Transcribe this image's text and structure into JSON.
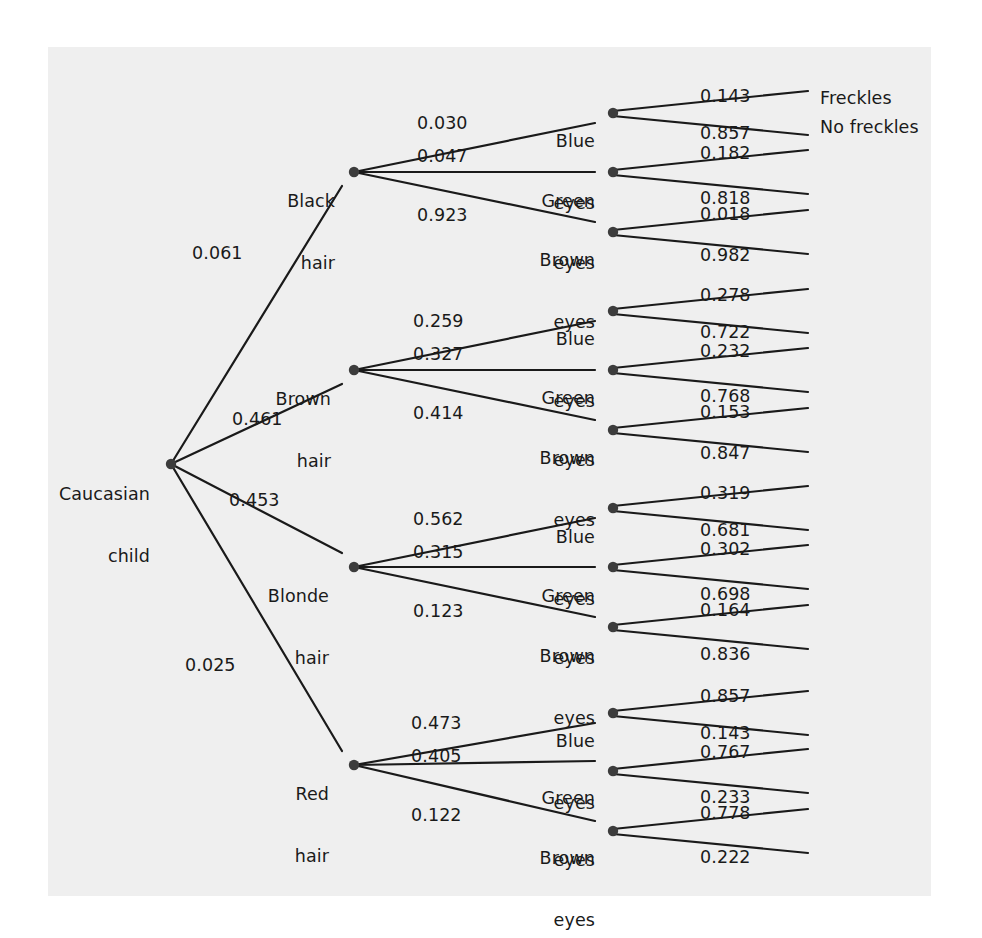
{
  "figure": {
    "background_color": "#ffffff",
    "panel_color": "#efefef",
    "ink_color": "#1a1a1a"
  },
  "root": {
    "label_line1": "Caucasian",
    "label_line2": "child"
  },
  "terminals": {
    "freckles": "Freckles",
    "no_freckles": "No freckles"
  },
  "hair": [
    {
      "line1": "Black",
      "line2": "hair",
      "p": "0.061",
      "eyes": [
        {
          "line1": "Blue",
          "line2": "eyes",
          "p": "0.030",
          "freckles_p": "0.143",
          "no_freckles_p": "0.857"
        },
        {
          "line1": "Green",
          "line2": "eyes",
          "p": "0.047",
          "freckles_p": "0.182",
          "no_freckles_p": "0.818"
        },
        {
          "line1": "Brown",
          "line2": "eyes",
          "p": "0.923",
          "freckles_p": "0.018",
          "no_freckles_p": "0.982"
        }
      ]
    },
    {
      "line1": "Brown",
      "line2": "hair",
      "p": "0.461",
      "eyes": [
        {
          "line1": "Blue",
          "line2": "eyes",
          "p": "0.259",
          "freckles_p": "0.278",
          "no_freckles_p": "0.722"
        },
        {
          "line1": "Green",
          "line2": "eyes",
          "p": "0.327",
          "freckles_p": "0.232",
          "no_freckles_p": "0.768"
        },
        {
          "line1": "Brown",
          "line2": "eyes",
          "p": "0.414",
          "freckles_p": "0.153",
          "no_freckles_p": "0.847"
        }
      ]
    },
    {
      "line1": "Blonde",
      "line2": "hair",
      "p": "0.453",
      "eyes": [
        {
          "line1": "Blue",
          "line2": "eyes",
          "p": "0.562",
          "freckles_p": "0.319",
          "no_freckles_p": "0.681"
        },
        {
          "line1": "Green",
          "line2": "eyes",
          "p": "0.315",
          "freckles_p": "0.302",
          "no_freckles_p": "0.698"
        },
        {
          "line1": "Brown",
          "line2": "eyes",
          "p": "0.123",
          "freckles_p": "0.164",
          "no_freckles_p": "0.836"
        }
      ]
    },
    {
      "line1": "Red",
      "line2": "hair",
      "p": "0.025",
      "eyes": [
        {
          "line1": "Blue",
          "line2": "eyes",
          "p": "0.473",
          "freckles_p": "0.857",
          "no_freckles_p": "0.143"
        },
        {
          "line1": "Green",
          "line2": "eyes",
          "p": "0.405",
          "freckles_p": "0.767",
          "no_freckles_p": "0.233"
        },
        {
          "line1": "Brown",
          "line2": "eyes",
          "p": "0.122",
          "freckles_p": "0.778",
          "no_freckles_p": "0.222"
        }
      ]
    }
  ],
  "chart_data": {
    "type": "diagram",
    "diagram_type": "probability-tree",
    "title": "",
    "root": "Caucasian child",
    "levels": [
      "hair colour",
      "eye colour",
      "freckles"
    ],
    "branches": [
      {
        "hair": "Black hair",
        "p_hair": 0.061,
        "eyes": [
          {
            "eye": "Blue eyes",
            "p_eye": 0.03,
            "freckles": 0.143,
            "no_freckles": 0.857
          },
          {
            "eye": "Green eyes",
            "p_eye": 0.047,
            "freckles": 0.182,
            "no_freckles": 0.818
          },
          {
            "eye": "Brown eyes",
            "p_eye": 0.923,
            "freckles": 0.018,
            "no_freckles": 0.982
          }
        ]
      },
      {
        "hair": "Brown hair",
        "p_hair": 0.461,
        "eyes": [
          {
            "eye": "Blue eyes",
            "p_eye": 0.259,
            "freckles": 0.278,
            "no_freckles": 0.722
          },
          {
            "eye": "Green eyes",
            "p_eye": 0.327,
            "freckles": 0.232,
            "no_freckles": 0.768
          },
          {
            "eye": "Brown eyes",
            "p_eye": 0.414,
            "freckles": 0.153,
            "no_freckles": 0.847
          }
        ]
      },
      {
        "hair": "Blonde hair",
        "p_hair": 0.453,
        "eyes": [
          {
            "eye": "Blue eyes",
            "p_eye": 0.562,
            "freckles": 0.319,
            "no_freckles": 0.681
          },
          {
            "eye": "Green eyes",
            "p_eye": 0.315,
            "freckles": 0.302,
            "no_freckles": 0.698
          },
          {
            "eye": "Brown eyes",
            "p_eye": 0.123,
            "freckles": 0.164,
            "no_freckles": 0.836
          }
        ]
      },
      {
        "hair": "Red hair",
        "p_hair": 0.025,
        "eyes": [
          {
            "eye": "Blue eyes",
            "p_eye": 0.473,
            "freckles": 0.857,
            "no_freckles": 0.143
          },
          {
            "eye": "Green eyes",
            "p_eye": 0.405,
            "freckles": 0.767,
            "no_freckles": 0.233
          },
          {
            "eye": "Brown eyes",
            "p_eye": 0.122,
            "freckles": 0.778,
            "no_freckles": 0.222
          }
        ]
      }
    ],
    "terminal_labels": [
      "Freckles",
      "No freckles"
    ]
  }
}
